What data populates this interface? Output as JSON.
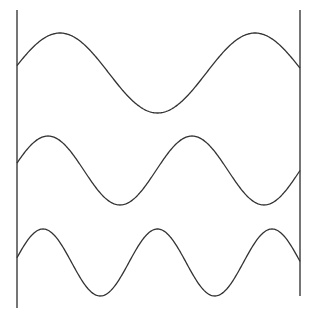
{
  "diagram": {
    "stroke_color": "#333333",
    "background": "#ffffff",
    "walls": [
      {
        "name": "left-wall",
        "x": 17,
        "y1": 10,
        "y2": 308
      },
      {
        "name": "right-wall",
        "x": 300,
        "y1": 10,
        "y2": 296
      }
    ],
    "waves": [
      {
        "name": "standing-wave-1",
        "x_start": 17,
        "x_end": 300,
        "center_y": 73,
        "amplitude": 40,
        "period": 195,
        "peak_x": 60
      },
      {
        "name": "standing-wave-2",
        "x_start": 17,
        "x_end": 300,
        "center_y": 170.5,
        "amplitude": 34.5,
        "period": 144,
        "peak_x": 48
      },
      {
        "name": "standing-wave-3",
        "x_start": 17,
        "x_end": 300,
        "center_y": 262.5,
        "amplitude": 33.5,
        "period": 114.5,
        "peak_x": 43
      }
    ]
  }
}
